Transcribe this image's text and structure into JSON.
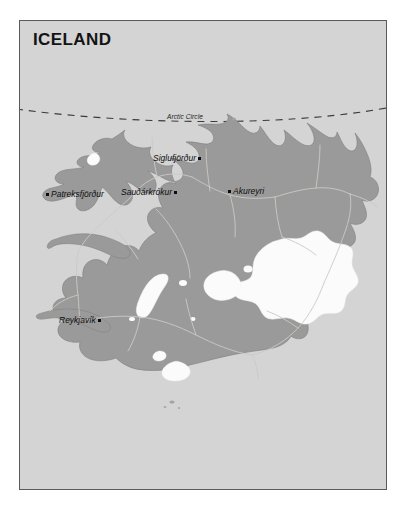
{
  "map": {
    "title": "ICELAND",
    "background_color": "#d4d4d4",
    "land_color": "#9a9a9a",
    "glacier_color": "#fbfbfb",
    "border_color": "#5a5a5a",
    "label_color": "#101010",
    "arctic_circle": {
      "label": "Arctic Circle",
      "style": "dashed"
    },
    "cities": [
      {
        "name": "Patreksfjörður",
        "marker": "dot",
        "marker_side": "left",
        "x": 26,
        "y": 169
      },
      {
        "name": "Siglufjörður",
        "marker": "dot",
        "marker_side": "right",
        "x": 133,
        "y": 133
      },
      {
        "name": "Sauðárkrókur",
        "marker": "dot",
        "marker_side": "right",
        "x": 101,
        "y": 167
      },
      {
        "name": "Akureyri",
        "marker": "dot",
        "marker_side": "left",
        "x": 208,
        "y": 166
      },
      {
        "name": "Reykjavík",
        "marker": "dot",
        "marker_side": "right",
        "x": 39,
        "y": 295
      }
    ]
  }
}
